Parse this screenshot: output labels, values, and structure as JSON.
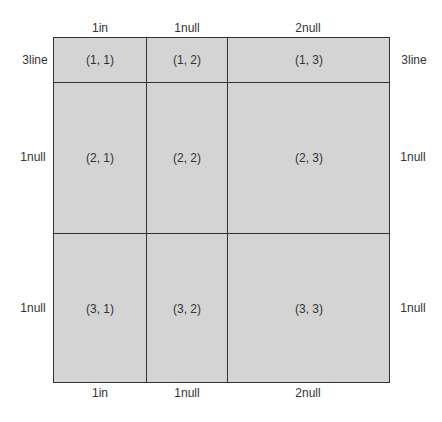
{
  "diagram": {
    "column_specs_top": [
      "1in",
      "1null",
      "2null"
    ],
    "column_specs_bottom": [
      "1in",
      "1null",
      "2null"
    ],
    "row_specs_left": [
      "3line",
      "1null",
      "1null"
    ],
    "row_specs_right": [
      "3line",
      "1null",
      "1null"
    ],
    "cells": [
      [
        "(1, 1)",
        "(1, 2)",
        "(1, 3)"
      ],
      [
        "(2, 1)",
        "(2, 2)",
        "(2, 3)"
      ],
      [
        "(3, 1)",
        "(3, 2)",
        "(3, 3)"
      ]
    ],
    "colors": {
      "cell_fill": "#d4d4d4",
      "grid_line": "#333333"
    }
  }
}
